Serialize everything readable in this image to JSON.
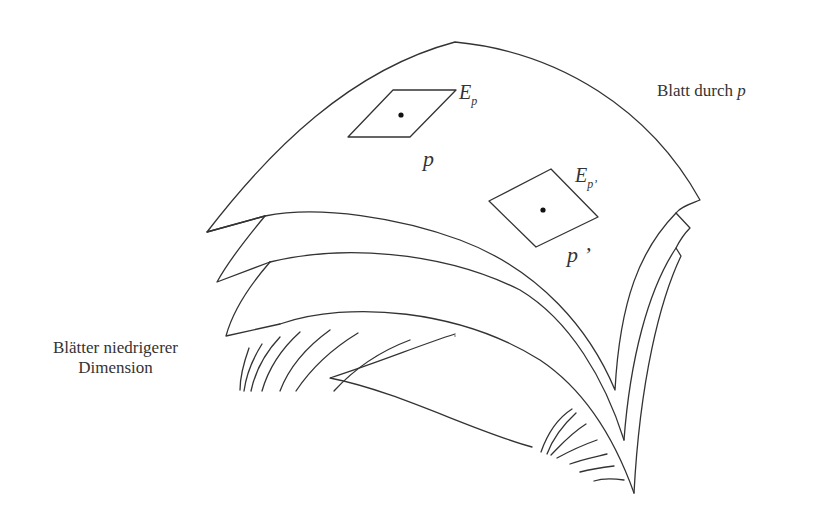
{
  "diagram": {
    "stroke_color": "#333333",
    "background": "#ffffff",
    "labels": {
      "leaf_through_p": {
        "text": "Blatt durch ",
        "var": "p"
      },
      "lower_dim_leaves_line1": "Blätter niedrigerer",
      "lower_dim_leaves_line2": "Dimension",
      "plane_p": {
        "main": "E",
        "sub": "p"
      },
      "point_p": "p",
      "plane_p_prime": {
        "main": "E",
        "sub": "p’"
      },
      "point_p_prime": "p ’"
    },
    "elements": [
      "leaf-through-p (top sheet)",
      "stacked leaves (3 sheets below)",
      "tangent plane E_p at point p",
      "tangent plane E_p' at point p'",
      "hatched lower-dimensional leaves (left and bottom right)"
    ]
  }
}
